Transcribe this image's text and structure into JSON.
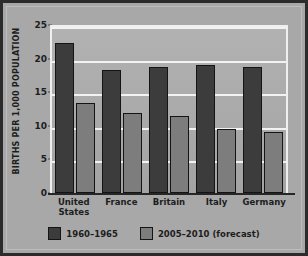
{
  "chart_data": {
    "type": "bar",
    "title": "",
    "xlabel": "",
    "ylabel": "BIRTHS PER 1,000 POPULATION",
    "ylim": [
      0,
      25
    ],
    "yticks": [
      0,
      5,
      10,
      15,
      20,
      25
    ],
    "ytick_labels": [
      "0",
      "5",
      "10",
      "15",
      "20",
      "25"
    ],
    "grid": true,
    "legend_position": "bottom",
    "categories": [
      "United\nStates",
      "France",
      "Britain",
      "Italy",
      "Germany"
    ],
    "category_labels": [
      "United States",
      "France",
      "Britain",
      "Italy",
      "Germany"
    ],
    "series": [
      {
        "name": "1960–1965",
        "color": "#3c3c3c",
        "values": [
          22.3,
          18.3,
          18.7,
          19.0,
          18.7
        ]
      },
      {
        "name": "2005–2010 (forecast)",
        "color": "#7d7d7d",
        "values": [
          13.4,
          11.9,
          11.4,
          9.5,
          9.1
        ]
      }
    ]
  },
  "legend": {
    "items": [
      {
        "label": "1960–1965"
      },
      {
        "label": "2005–2010 (forecast)"
      }
    ]
  },
  "colors": {
    "series_1960": "#3c3c3c",
    "series_2005": "#7d7d7d",
    "background": "#a8a8a8",
    "gridline": "#f2f2f2",
    "frame": "#2b2b2b"
  }
}
